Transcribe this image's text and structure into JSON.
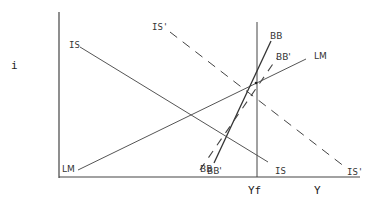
{
  "diagram": {
    "type": "IS-LM-BB macroeconomic diagram",
    "axes": {
      "y_label": "i",
      "x_label": "Y",
      "full_employment_label": "Yf"
    },
    "curves": {
      "IS": {
        "label_top": "IS",
        "label_bottom": "IS",
        "style": "solid"
      },
      "IS_prime": {
        "label_top": "IS'",
        "label_bottom": "IS'",
        "style": "dashed"
      },
      "LM": {
        "label_left": "LM",
        "label_right": "LM",
        "style": "solid"
      },
      "BB": {
        "label_top": "BB",
        "label_bottom": "BB",
        "style": "solid"
      },
      "BB_prime": {
        "label_top": "BB'",
        "label_bottom": "BB'",
        "style": "dashed"
      }
    },
    "colors": {
      "line": "#444444",
      "background": "#ffffff"
    }
  }
}
